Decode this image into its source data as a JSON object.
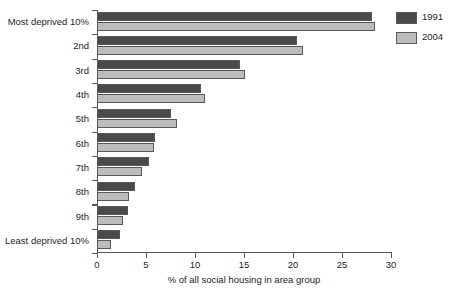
{
  "chart_data": {
    "type": "bar",
    "orientation": "horizontal",
    "title": "",
    "xlabel": "% of all social housing in area group",
    "ylabel": "",
    "xlim": [
      0,
      30
    ],
    "xticks": [
      0,
      5,
      10,
      15,
      20,
      25,
      30
    ],
    "xtick_labels": [
      "0",
      "5",
      "10",
      "15",
      "20",
      "25",
      "30"
    ],
    "grid": false,
    "legend_position": "top-right",
    "categories": [
      "Most deprived 10%",
      "2nd",
      "3rd",
      "4th",
      "5th",
      "6th",
      "7th",
      "8th",
      "9th",
      "Least deprived 10%"
    ],
    "series": [
      {
        "name": "1991",
        "color": "#4a4a4a",
        "values": [
          28.1,
          20.4,
          14.6,
          10.6,
          7.5,
          5.9,
          5.3,
          3.9,
          3.2,
          2.3
        ]
      },
      {
        "name": "2004",
        "color": "#bcbcbc",
        "values": [
          28.4,
          21.0,
          15.1,
          11.0,
          8.2,
          5.8,
          4.6,
          3.3,
          2.7,
          1.4
        ]
      }
    ]
  },
  "axis": {
    "x_title": "% of all social housing in area group"
  },
  "legend": {
    "items": [
      {
        "label": "1991",
        "color": "#4a4a4a"
      },
      {
        "label": "2004",
        "color": "#bcbcbc"
      }
    ]
  }
}
